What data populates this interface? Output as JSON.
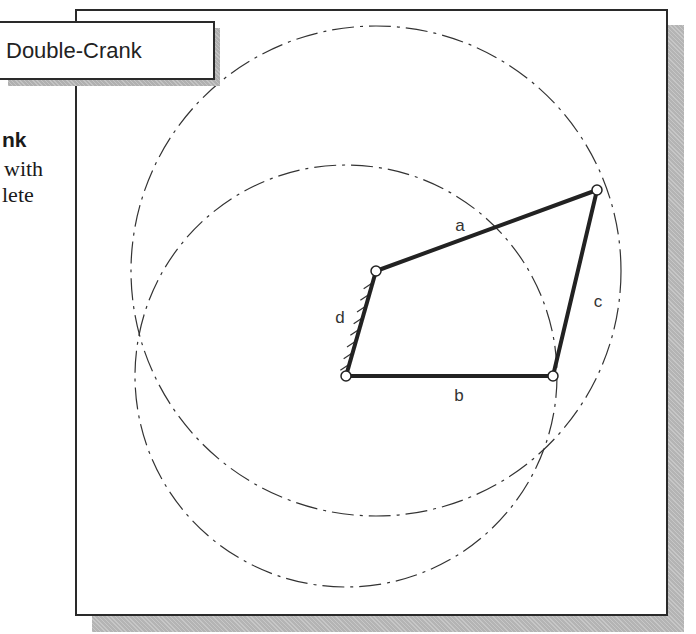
{
  "title_label": "Double-Crank",
  "side_text": {
    "line_bold": "nk",
    "line_1": "with",
    "line_2": "lete"
  },
  "linkage": {
    "joints": [
      {
        "name": "ground-pivot-upper",
        "x": 376,
        "y": 271
      },
      {
        "name": "coupler-joint",
        "x": 597,
        "y": 190
      },
      {
        "name": "joint-right",
        "x": 553,
        "y": 376
      },
      {
        "name": "ground-pivot-lower",
        "x": 346,
        "y": 376
      }
    ],
    "links": [
      {
        "label": "a",
        "from": 0,
        "to": 1,
        "label_x": 460,
        "label_y": 231
      },
      {
        "label": "c",
        "from": 1,
        "to": 2,
        "label_x": 598,
        "label_y": 307
      },
      {
        "label": "b",
        "from": 2,
        "to": 3,
        "label_x": 459,
        "label_y": 401
      },
      {
        "label": "d",
        "from": 3,
        "to": 0,
        "label_x": 340,
        "label_y": 323,
        "ground": true
      }
    ],
    "circles": [
      {
        "name": "path-circle-a",
        "cx": 376,
        "cy": 271,
        "r": 245
      },
      {
        "name": "path-circle-b",
        "cx": 346,
        "cy": 376,
        "r": 211
      }
    ]
  },
  "colors": {
    "line": "#222222",
    "dash": "#333333",
    "shadow": "#b4b4b4"
  }
}
